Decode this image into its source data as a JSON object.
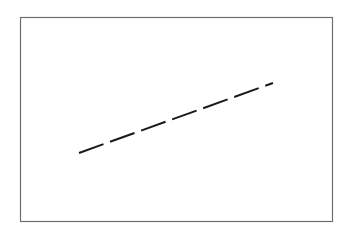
{
  "diagram": {
    "frame": {
      "x": 20.5,
      "y": 17.5,
      "width": 312,
      "height": 204,
      "stroke": "#6e6e6e",
      "stroke_width": 1.2
    },
    "line": {
      "x1": 79,
      "y1": 153,
      "x2": 273,
      "y2": 83,
      "stroke": "#1a1a1a",
      "stroke_width": 2,
      "dash_pattern": "26 7",
      "style": "dashed"
    }
  }
}
